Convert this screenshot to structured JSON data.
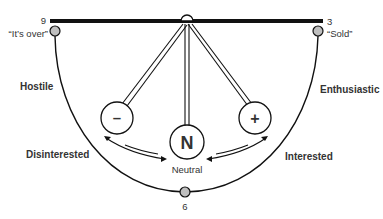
{
  "diagram": {
    "type": "pendulum-scale",
    "colors": {
      "line": "#111111",
      "text": "#333333",
      "node_fill": "#bfbfbf",
      "background": "#ffffff"
    },
    "endpoints": {
      "left": {
        "number": "9",
        "quote": "“It’s over”"
      },
      "right": {
        "number": "3",
        "quote": "“Sold”"
      },
      "bottom": {
        "number": "6"
      }
    },
    "arc_labels": {
      "upper_left": "Hostile",
      "lower_left": "Disinterested",
      "upper_right": "Enthusiastic",
      "lower_right": "Interested"
    },
    "pendulums": [
      {
        "id": "negative",
        "symbol": "–"
      },
      {
        "id": "neutral",
        "symbol": "N",
        "label": "Neutral"
      },
      {
        "id": "positive",
        "symbol": "+"
      }
    ]
  }
}
